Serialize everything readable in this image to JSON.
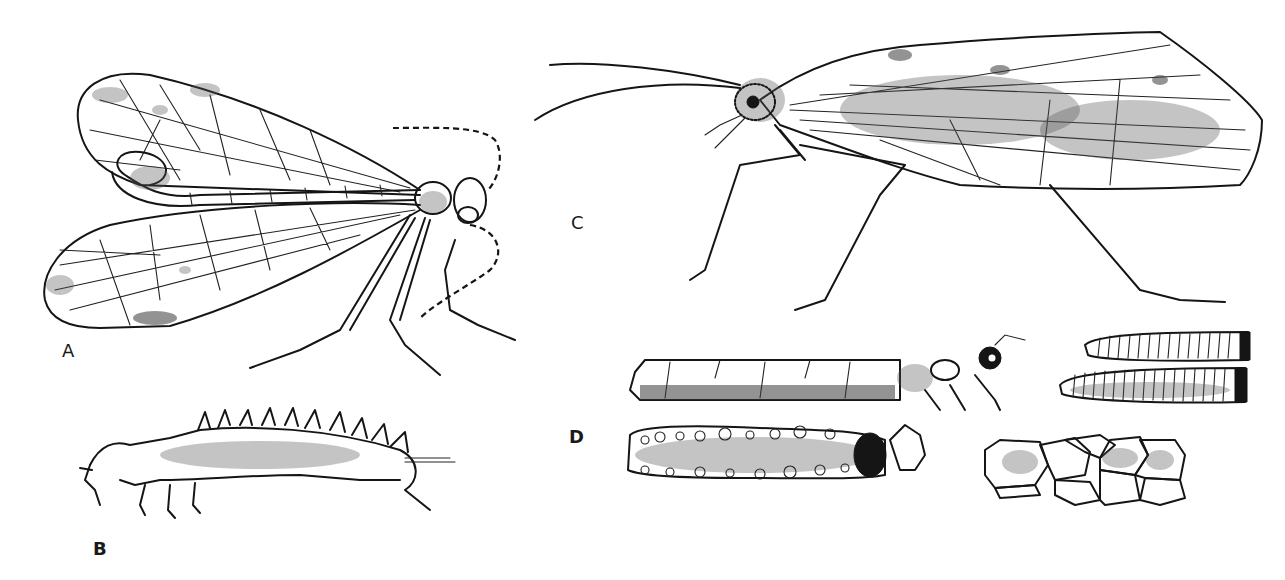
{
  "figure": {
    "type": "scientific-illustration-plate",
    "style": "black-and-white pen-and-ink drawing",
    "background_color": "#ffffff",
    "ink_color": "#151515",
    "panels": [
      {
        "id": "A",
        "label": "A",
        "subject": "adult winged insect (dorsolateral view, wings spread, long dashed antenna)"
      },
      {
        "id": "B",
        "label": "B",
        "subject": "larva (lateral view, spiny dorsal processes, three pairs of legs)"
      },
      {
        "id": "C",
        "label": "C",
        "subject": "adult caddisfly-like insect (lateral view, roof-like patterned wing, long antennae)"
      },
      {
        "id": "D",
        "label": "D",
        "subject": "larval cases: plant-piece case with emerging larva, sand-grain case, two tapered ribbed cases, stone case"
      }
    ]
  }
}
